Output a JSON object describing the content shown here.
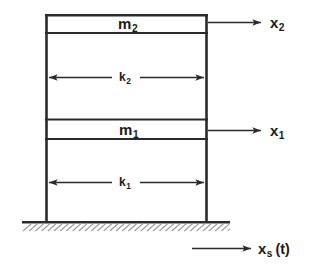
{
  "figure": {
    "type": "two-story-shear-frame-schematic",
    "title": "",
    "background_color": "#ffffff",
    "line_color": "#2b2b2b",
    "hatch_color": "#9a9a9a"
  },
  "masses": [
    {
      "id": "m2",
      "name": "upper-mass",
      "symbol": "m",
      "subscript": "2",
      "label": "m₂",
      "box": {
        "x": 45,
        "y": 14,
        "width": 163,
        "height": 19
      }
    },
    {
      "id": "m1",
      "name": "lower-mass",
      "symbol": "m",
      "subscript": "1",
      "label": "m₁",
      "box": {
        "x": 45,
        "y": 119,
        "width": 163,
        "height": 20
      }
    }
  ],
  "springs": [
    {
      "id": "k2",
      "name": "upper-story-stiffness",
      "symbol": "k",
      "subscript": "2",
      "label": "k₂",
      "arrow_y": 77,
      "arrow_x_start": 48,
      "arrow_x_end": 205
    },
    {
      "id": "k1",
      "name": "lower-story-stiffness",
      "symbol": "k",
      "subscript": "1",
      "label": "k₁",
      "arrow_y": 182,
      "arrow_x_start": 48,
      "arrow_x_end": 205
    }
  ],
  "coordinates": [
    {
      "id": "x2",
      "name": "upper-mass-displacement",
      "symbol": "x",
      "subscript": "2",
      "suffix": "",
      "label": "x₂",
      "arrow_y": 22,
      "arrow_x_start": 209,
      "arrow_x_end": 262,
      "label_x": 270,
      "label_y": 14
    },
    {
      "id": "x1",
      "name": "lower-mass-displacement",
      "symbol": "x",
      "subscript": "1",
      "suffix": "",
      "label": "x₁",
      "arrow_y": 130,
      "arrow_x_start": 209,
      "arrow_x_end": 262,
      "label_x": 270,
      "label_y": 122
    },
    {
      "id": "xs",
      "name": "ground-support-motion",
      "symbol": "x",
      "subscript": "s",
      "suffix": "(t)",
      "label": "xₛ (t)",
      "arrow_y": 248,
      "arrow_x_start": 192,
      "arrow_x_end": 252,
      "label_x": 258,
      "label_y": 240
    }
  ],
  "frame": {
    "name": "column-frame",
    "left_x": 45,
    "right_x": 208,
    "top_y": 14,
    "base_y": 222
  },
  "ground": {
    "name": "fixed-base-hatching",
    "line_y": 222,
    "line_x_start": 22,
    "line_x_end": 230,
    "hatch_count": 34
  }
}
